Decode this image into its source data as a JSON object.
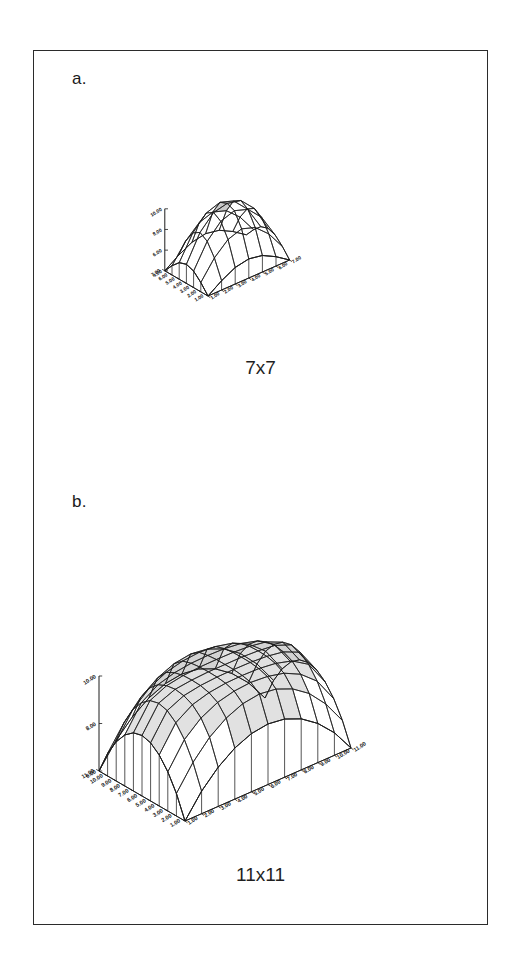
{
  "figure": {
    "background_color": "#ffffff",
    "frame_color": "#2b2b2b",
    "line_color": "#1c1c1c",
    "fill_color": "#ffffff",
    "shaded_facet_color": "#c9c9c9"
  },
  "panels": [
    {
      "id": "a",
      "label": "a.",
      "caption": "7x7",
      "grid": "7x7"
    },
    {
      "id": "b",
      "label": "b.",
      "caption": "11x11",
      "grid": "11x11"
    }
  ],
  "chart_data": [
    {
      "type": "surface",
      "panel": "a",
      "title": "7x7",
      "grid_size": [
        7,
        7
      ],
      "xlabel": "",
      "ylabel": "",
      "zlabel": "",
      "x_ticks": [
        "1.00",
        "2.00",
        "3.00",
        "4.00",
        "5.00",
        "6.00",
        "7.00"
      ],
      "y_ticks": [
        "1.00",
        "2.00",
        "3.00",
        "4.00",
        "5.00",
        "6.00",
        "7.00"
      ],
      "z_ticks": [
        "4.00",
        "6.00",
        "8.00",
        "10.00"
      ],
      "zlim": [
        4.0,
        10.0
      ],
      "xlim": [
        1,
        7
      ],
      "ylim": [
        1,
        7
      ],
      "grid": true,
      "legend": "none",
      "surface_description": "dome / paraboloid peaking at center, falling to edges",
      "z_values": [
        [
          4.0,
          4.9,
          5.6,
          5.85,
          5.6,
          4.9,
          4.0
        ],
        [
          4.9,
          6.7,
          7.9,
          8.35,
          7.9,
          6.7,
          4.9
        ],
        [
          5.6,
          7.9,
          9.25,
          9.7,
          9.25,
          7.9,
          5.6
        ],
        [
          5.85,
          8.35,
          9.7,
          10.0,
          9.7,
          8.35,
          5.85
        ],
        [
          5.6,
          7.9,
          9.25,
          9.7,
          9.25,
          7.9,
          5.6
        ],
        [
          4.9,
          6.7,
          7.9,
          8.35,
          7.9,
          6.7,
          4.9
        ],
        [
          4.0,
          4.9,
          5.6,
          5.85,
          5.6,
          4.9,
          4.0
        ]
      ]
    },
    {
      "type": "surface",
      "panel": "b",
      "title": "11x11",
      "grid_size": [
        11,
        11
      ],
      "xlabel": "",
      "ylabel": "",
      "zlabel": "",
      "x_ticks": [
        "1.00",
        "2.00",
        "3.00",
        "4.00",
        "5.00",
        "6.00",
        "7.00",
        "8.00",
        "9.00",
        "10.00",
        "11.00"
      ],
      "y_ticks": [
        "1.00",
        "2.00",
        "3.00",
        "4.00",
        "5.00",
        "6.00",
        "7.00",
        "8.00",
        "9.00",
        "10.00",
        "11.00"
      ],
      "z_ticks": [
        "6.00",
        "8.00",
        "10.00"
      ],
      "zlim": [
        6.0,
        10.0
      ],
      "xlim": [
        1,
        11
      ],
      "ylim": [
        1,
        11
      ],
      "grid": true,
      "legend": "none",
      "surface_description": "broad flattened dome / plateau peaking at center, steep near edges",
      "z_values": [
        [
          6.0,
          6.95,
          7.65,
          8.15,
          8.45,
          8.55,
          8.45,
          8.15,
          7.65,
          6.95,
          6.0
        ],
        [
          6.95,
          7.95,
          8.7,
          9.2,
          9.5,
          9.6,
          9.5,
          9.2,
          8.7,
          7.95,
          6.95
        ],
        [
          7.65,
          8.7,
          9.3,
          9.65,
          9.82,
          9.88,
          9.82,
          9.65,
          9.3,
          8.7,
          7.65
        ],
        [
          8.15,
          9.2,
          9.65,
          9.85,
          9.94,
          9.96,
          9.94,
          9.85,
          9.65,
          9.2,
          8.15
        ],
        [
          8.45,
          9.5,
          9.82,
          9.94,
          9.99,
          10.0,
          9.99,
          9.94,
          9.82,
          9.5,
          8.45
        ],
        [
          8.55,
          9.6,
          9.88,
          9.96,
          10.0,
          10.0,
          10.0,
          9.96,
          9.88,
          9.6,
          8.55
        ],
        [
          8.45,
          9.5,
          9.82,
          9.94,
          9.99,
          10.0,
          9.99,
          9.94,
          9.82,
          9.5,
          8.45
        ],
        [
          8.15,
          9.2,
          9.65,
          9.85,
          9.94,
          9.96,
          9.94,
          9.85,
          9.65,
          9.2,
          8.15
        ],
        [
          7.65,
          8.7,
          9.3,
          9.65,
          9.82,
          9.88,
          9.82,
          9.65,
          9.3,
          8.7,
          7.65
        ],
        [
          6.95,
          7.95,
          8.7,
          9.2,
          9.5,
          9.6,
          9.5,
          9.2,
          8.7,
          7.95,
          6.95
        ],
        [
          6.0,
          6.95,
          7.65,
          8.15,
          8.45,
          8.55,
          8.45,
          8.15,
          7.65,
          6.95,
          6.0
        ]
      ]
    }
  ]
}
